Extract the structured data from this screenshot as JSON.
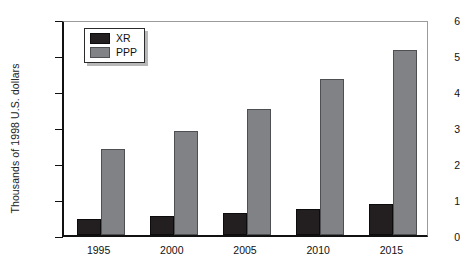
{
  "chart_data": {
    "type": "bar",
    "title": "",
    "subtitle": "",
    "xlabel": "",
    "ylabel": "Thousands of 1998 U.S. dollars",
    "categories": [
      "1995",
      "2000",
      "2005",
      "2010",
      "2015"
    ],
    "series": [
      {
        "name": "XR",
        "values": [
          0.45,
          0.53,
          0.6,
          0.72,
          0.85
        ],
        "color": "#231f20"
      },
      {
        "name": "PPP",
        "values": [
          2.4,
          2.9,
          3.5,
          4.33,
          5.15
        ],
        "color": "#808285"
      }
    ],
    "ylim": [
      0,
      6
    ],
    "yticks": [
      0,
      1,
      2,
      3,
      4,
      5,
      6
    ],
    "ytick_labels": [
      "0",
      "1",
      "2",
      "3",
      "4",
      "5",
      "6"
    ],
    "grid": false,
    "legend": {
      "position": "top-left",
      "entries": [
        {
          "label": "XR",
          "color": "#231f20"
        },
        {
          "label": "PPP",
          "color": "#808285"
        }
      ]
    }
  }
}
